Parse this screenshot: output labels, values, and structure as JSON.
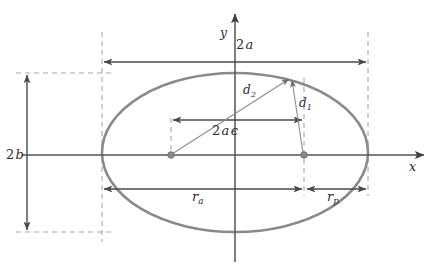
{
  "figure": {
    "kind": "ellipse-orbit-geometry-diagram",
    "background_color": "#ffffff"
  },
  "colors": {
    "ellipse_stroke": "#8a8a8a",
    "axis_stroke": "#555555",
    "dimension_stroke": "#4a4a4a",
    "thin_line_stroke": "#8d8d8d",
    "dashed_stroke": "#a8a8a8",
    "focus_dot_fill": "#8a8a8a",
    "label_color": "#2b2b2b"
  },
  "axes": {
    "x_axis": {
      "label": "x",
      "label_x": 409,
      "label_y": 162,
      "y": 155,
      "x_start": 22,
      "x_end": 427
    },
    "y_axis": {
      "label": "y",
      "label_x": 220,
      "label_y": 27,
      "x": 235,
      "y_start": 262,
      "y_end": 10
    }
  },
  "labels": {
    "major_axis": {
      "text": "2 a",
      "number": "2",
      "symbol": "a",
      "x": 236,
      "y": 45
    },
    "minor_axis": {
      "text": "2 b",
      "number": "2",
      "symbol": "b",
      "x": 6,
      "y": 148
    },
    "focal_separation": {
      "text": "2 a ϵ",
      "number": "2",
      "symbol": "a",
      "symbol2": "ϵ",
      "x": 212,
      "y": 124
    },
    "distance_d2": {
      "text": "d2",
      "symbol": "d",
      "subscript": "2",
      "x": 243,
      "y": 87
    },
    "distance_d1": {
      "text": "d1",
      "symbol": "d",
      "subscript": "1",
      "x": 298,
      "y": 100
    },
    "apoapsis_radius": {
      "text": "ra",
      "symbol": "r",
      "subscript": "a",
      "x": 192,
      "y": 193
    },
    "periapsis_radius": {
      "text": "rp",
      "symbol": "r",
      "subscript": "p",
      "x": 327,
      "y": 193
    }
  },
  "ellipse": {
    "center_x": 235,
    "center_y": 152.5,
    "semi_major_px": 133,
    "semi_minor_px": 79.5,
    "left_vertex_x": 102,
    "right_vertex_x": 368,
    "top_y": 73,
    "bottom_y": 232,
    "stroke_width": 2.6
  },
  "foci": {
    "left_focus": {
      "x": 171,
      "y": 155,
      "r": 3.2
    },
    "right_focus": {
      "x": 304,
      "y": 155,
      "r": 3.2
    }
  },
  "orbit_point": {
    "x": 291,
    "y": 77
  },
  "dimension_lines": {
    "major_axis_arrow": {
      "y": 62,
      "x1": 102,
      "x2": 368
    },
    "minor_axis_arrow": {
      "x": 27,
      "y1": 73,
      "y2": 232
    },
    "focal_arrow": {
      "y": 120,
      "x1": 171,
      "x2": 304
    },
    "apoapsis_arrow": {
      "y": 189,
      "x1": 102,
      "x2": 304
    },
    "periapsis_arrow": {
      "y": 189,
      "x1": 304,
      "x2": 368
    }
  },
  "guides": {
    "vertical_dashed_left": {
      "x": 102,
      "y1": 32,
      "y2": 242
    },
    "vertical_dashed_right": {
      "x": 368,
      "y1": 32,
      "y2": 196
    },
    "horizontal_dashed_top": {
      "y": 73,
      "x1": 18,
      "x2": 110
    },
    "horizontal_dashed_bottom": {
      "y": 232,
      "x1": 18,
      "x2": 110
    },
    "focus_vertical_left": {
      "x": 171,
      "y1": 120,
      "y2": 155
    },
    "point_vertical_right": {
      "x": 304,
      "y1": 77,
      "y2": 196
    }
  },
  "footer": {
    "fragment": ""
  }
}
